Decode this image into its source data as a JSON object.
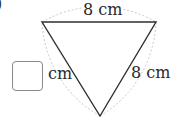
{
  "figure": {
    "part_label": ")",
    "shape": "equilateral triangle with dotted circular arcs (Reuleaux triangle)",
    "labels": {
      "top_side": "8 cm",
      "right_side": "8 cm",
      "left_side_unit": "cm"
    },
    "answer_box": {
      "value": "",
      "placeholder": ""
    },
    "colors": {
      "triangle_stroke": "#2f2f2f",
      "arc_stroke": "#c8c8c8",
      "box_border": "#8a8a8a",
      "text": "#2a2a2a"
    }
  }
}
